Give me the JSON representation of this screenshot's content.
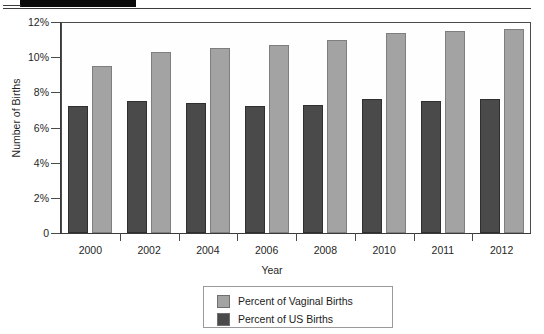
{
  "page": {
    "redaction_bar": "redacted-black-bar"
  },
  "chart_data": {
    "type": "bar",
    "title": "",
    "xlabel": "Year",
    "ylabel": "Number of Births",
    "categories": [
      "2000",
      "2002",
      "2004",
      "2006",
      "2008",
      "2010",
      "2011",
      "2012"
    ],
    "series": [
      {
        "name": "Percent of Vaginal Births",
        "color": "#a3a3a3",
        "values": [
          9.5,
          10.3,
          10.5,
          10.7,
          11.0,
          11.4,
          11.5,
          11.6
        ]
      },
      {
        "name": "Percent of US Births",
        "color": "#4a4a4a",
        "values": [
          7.2,
          7.5,
          7.4,
          7.2,
          7.3,
          7.6,
          7.5,
          7.6
        ]
      }
    ],
    "ylim": [
      0,
      12
    ],
    "ytick_labels": [
      "0",
      "2%",
      "4%",
      "6%",
      "8%",
      "10%",
      "12%"
    ],
    "ytick_values": [
      0,
      2,
      4,
      6,
      8,
      10,
      12
    ],
    "grid": false,
    "legend_position": "bottom-center"
  }
}
